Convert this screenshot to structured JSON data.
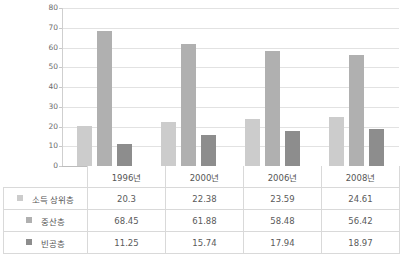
{
  "chart_data": {
    "type": "bar",
    "title": "",
    "xlabel": "",
    "ylabel": "",
    "ylim": [
      0,
      80
    ],
    "ytick_step": 10,
    "grid": true,
    "legend_position": "table-row-headers",
    "categories": [
      "1996년",
      "2000년",
      "2006년",
      "2008년"
    ],
    "series": [
      {
        "name": "소득 상위층",
        "color": "#cccccc",
        "values": [
          20.3,
          22.38,
          23.59,
          24.61
        ],
        "value_labels": [
          "20.3",
          "22.38",
          "23.59",
          "24.61"
        ]
      },
      {
        "name": "중산층",
        "color": "#b0b0b0",
        "values": [
          68.45,
          61.88,
          58.48,
          56.42
        ],
        "value_labels": [
          "68.45",
          "61.88",
          "58.48",
          "56.42"
        ]
      },
      {
        "name": "빈공층",
        "color": "#8d8d8d",
        "values": [
          11.25,
          15.74,
          17.94,
          18.97
        ],
        "value_labels": [
          "11.25",
          "15.74",
          "17.94",
          "18.97"
        ]
      }
    ],
    "ytick_labels": [
      "80",
      "70",
      "60",
      "50",
      "40",
      "30",
      "20",
      "10",
      "0"
    ]
  },
  "table": {
    "corner_label": "",
    "column_headers": [
      "1996년",
      "2000년",
      "2006년",
      "2008년"
    ],
    "rows": [
      {
        "label": "소득 상위층",
        "swatch": "#cccccc",
        "cells": [
          "20.3",
          "22.38",
          "23.59",
          "24.61"
        ]
      },
      {
        "label": "중산층",
        "swatch": "#b0b0b0",
        "cells": [
          "68.45",
          "61.88",
          "58.48",
          "56.42"
        ]
      },
      {
        "label": "빈공층",
        "swatch": "#8d8d8d",
        "cells": [
          "11.25",
          "15.74",
          "17.94",
          "18.97"
        ]
      }
    ]
  }
}
